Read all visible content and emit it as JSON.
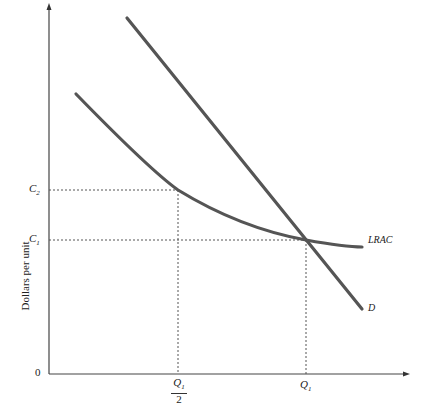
{
  "diagram": {
    "y_axis_label": "Dollars per unit",
    "origin_label": "0",
    "y_ticks": [
      {
        "label": "C",
        "sub": "2",
        "y": 190
      },
      {
        "label": "C",
        "sub": "1",
        "y": 240
      }
    ],
    "x_ticks": [
      {
        "label": "Q",
        "sub": "1",
        "denominator": "2",
        "x": 178
      },
      {
        "label": "Q",
        "sub": "1",
        "x": 306
      }
    ],
    "curves": [
      {
        "name": "LRAC",
        "label": "LRAC"
      },
      {
        "name": "D",
        "label": "D"
      }
    ],
    "colors": {
      "curve": "#555555",
      "axis": "#333333",
      "guide": "#444444"
    }
  }
}
